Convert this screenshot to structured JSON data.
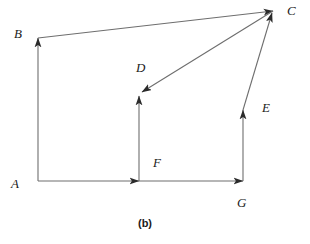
{
  "figure": {
    "caption": "(b)",
    "background_color": "#ffffff",
    "stroke_color": "#2b2b2b",
    "label_color": "#1a1a1a"
  },
  "diagram_data": {
    "type": "vector-diagram",
    "description": "Closed vector polygon with labelled arrows A, B, C, D, E, F, G",
    "points": {
      "A": {
        "x": 38,
        "y": 181
      },
      "B": {
        "x": 38,
        "y": 38
      },
      "C": {
        "x": 273,
        "y": 11
      },
      "D": {
        "x": 139,
        "y": 96
      },
      "E": {
        "x": 243,
        "y": 110
      },
      "F": {
        "x": 139,
        "y": 181
      },
      "G": {
        "x": 243,
        "y": 181
      }
    },
    "edges": [
      {
        "name": "A-to-B",
        "from": "A",
        "to": "B",
        "arrow": "end"
      },
      {
        "name": "B-to-C",
        "from": "B",
        "to": "C",
        "arrow": "end"
      },
      {
        "name": "A-to-F",
        "from": "A",
        "to": "F",
        "arrow": "end"
      },
      {
        "name": "F-to-G",
        "from": "F",
        "to": "G",
        "arrow": "end"
      },
      {
        "name": "F-to-D",
        "from": "F",
        "to": "D",
        "arrow": "end"
      },
      {
        "name": "C-to-D",
        "from": "C",
        "to": "D",
        "arrow": "end"
      },
      {
        "name": "G-to-E",
        "from": "G",
        "to": "E",
        "arrow": "end"
      },
      {
        "name": "E-to-C",
        "from": "E",
        "to": "C",
        "arrow": "end"
      }
    ],
    "labels": [
      {
        "id": "A",
        "text": "A",
        "x": 11,
        "y": 177
      },
      {
        "id": "B",
        "text": "B",
        "x": 14,
        "y": 27
      },
      {
        "id": "C",
        "text": "C",
        "x": 287,
        "y": 4
      },
      {
        "id": "D",
        "text": "D",
        "x": 136,
        "y": 61
      },
      {
        "id": "E",
        "text": "E",
        "x": 262,
        "y": 101
      },
      {
        "id": "F",
        "text": "F",
        "x": 153,
        "y": 156
      },
      {
        "id": "G",
        "text": "G",
        "x": 237,
        "y": 196
      }
    ]
  }
}
